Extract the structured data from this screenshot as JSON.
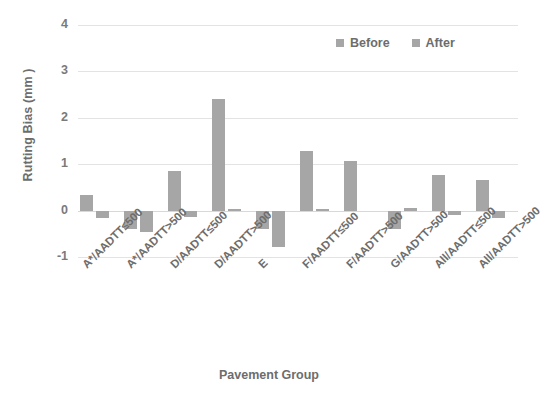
{
  "chart_data": {
    "type": "bar",
    "title": "",
    "xlabel": "Pavement Group",
    "ylabel": "Rutting Bias (mm )",
    "ylim": [
      -1,
      4
    ],
    "yticks": [
      4,
      3,
      2,
      1,
      0,
      -1
    ],
    "ytick_labels": [
      "4",
      "3",
      "2",
      "1",
      "0",
      "-1"
    ],
    "grid": true,
    "legend_position": "top-right",
    "categories": [
      "A*/AADTT≤500",
      "A*/AADTT>500",
      "D/AADTT≤500",
      "D/AADTT>500",
      "E",
      "F/AADTT≤500",
      "F/AADTT>500",
      "G/AADTT>500",
      "All/AADTT≤500",
      "All/AADTT>500"
    ],
    "series": [
      {
        "name": "Before",
        "color": "#a6a6a6",
        "values": [
          0.33,
          -0.4,
          0.85,
          2.4,
          -0.4,
          1.29,
          1.07,
          -0.4,
          0.77,
          0.65
        ]
      },
      {
        "name": "After",
        "color": "#a6a6a6",
        "values": [
          -0.17,
          -0.47,
          -0.13,
          0.04,
          -0.78,
          0.03,
          0.0,
          0.06,
          -0.1,
          -0.17
        ]
      }
    ]
  },
  "legend": {
    "items": [
      {
        "label": "Before",
        "swatch": "legend-swatch-before"
      },
      {
        "label": "After",
        "swatch": "legend-swatch-after"
      }
    ]
  },
  "axes": {
    "y_title": "Rutting Bias (mm )",
    "x_title": "Pavement Group"
  },
  "colors": {
    "bar": "#a6a6a6",
    "text": "#6d6d6d",
    "grid": "#e3e3e3",
    "background": "#ffffff"
  }
}
